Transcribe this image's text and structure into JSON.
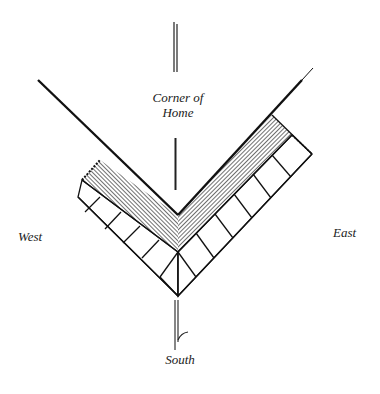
{
  "labels": {
    "corner": "Corner of",
    "corner_line2": "Home",
    "west": "West",
    "east": "East",
    "south": "South"
  },
  "diagram": {
    "elements": [
      "house-walls",
      "hatched-bed",
      "stepping-tiles",
      "center-axis-line",
      "south-pointer"
    ],
    "tiles_per_side": {
      "west": 4,
      "east": 6
    },
    "colors": {
      "ink": "#111111",
      "hatch": "#555555",
      "background": "#ffffff"
    }
  }
}
